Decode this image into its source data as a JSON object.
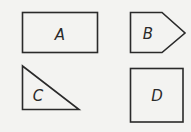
{
  "diagram": {
    "background": "#f3f3f1",
    "stroke_color": "#2a2a2a",
    "shapes": [
      {
        "id": "A",
        "label": "A",
        "type": "rectangle"
      },
      {
        "id": "B",
        "label": "B",
        "type": "pentagon"
      },
      {
        "id": "C",
        "label": "C",
        "type": "right-triangle"
      },
      {
        "id": "D",
        "label": "D",
        "type": "square"
      }
    ]
  }
}
